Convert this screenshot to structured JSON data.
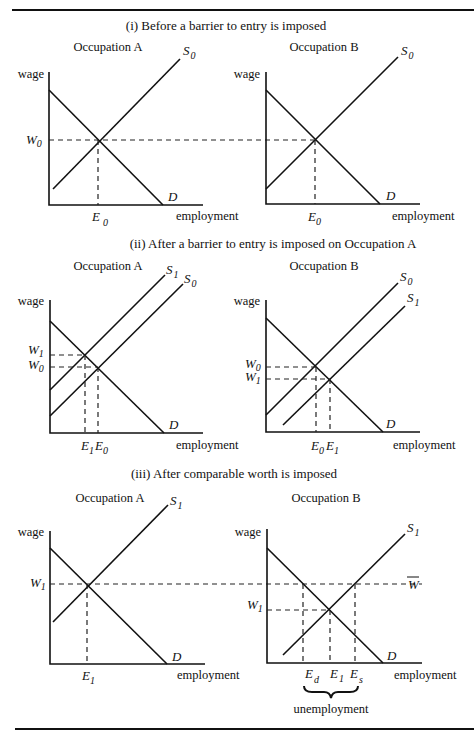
{
  "figure": {
    "panels": [
      {
        "title": "(i) Before a barrier to entry is imposed",
        "graphs": [
          {
            "occupation": "Occupation A",
            "y_axis_label": "wage",
            "x_axis_label": "employment",
            "supply_labels": [
              "S",
              "0"
            ],
            "demand_label": "D",
            "wage_labels": [
              [
                "W",
                "0"
              ]
            ],
            "employment_labels": [
              [
                "E",
                "0"
              ]
            ]
          },
          {
            "occupation": "Occupation B",
            "y_axis_label": "wage",
            "x_axis_label": "employment",
            "supply_labels": [
              "S",
              "0"
            ],
            "demand_label": "D",
            "employment_labels": [
              [
                "E",
                "0"
              ]
            ]
          }
        ]
      },
      {
        "title": "(ii) After a barrier to entry is imposed on Occupation A",
        "graphs": [
          {
            "occupation": "Occupation A",
            "y_axis_label": "wage",
            "x_axis_label": "employment",
            "supply_new": [
              "S",
              "1"
            ],
            "supply_old": [
              "S",
              "0"
            ],
            "demand_label": "D",
            "wage_labels": [
              [
                "W",
                "1"
              ],
              [
                "W",
                "0"
              ]
            ],
            "employment_labels": [
              [
                "E",
                "1"
              ],
              [
                "E",
                "0"
              ]
            ]
          },
          {
            "occupation": "Occupation B",
            "y_axis_label": "wage",
            "x_axis_label": "employment",
            "supply_old": [
              "S",
              "0"
            ],
            "supply_new": [
              "S",
              "1"
            ],
            "demand_label": "D",
            "wage_labels": [
              [
                "W",
                "0"
              ],
              [
                "W",
                "1"
              ]
            ],
            "employment_labels": [
              [
                "E",
                "0"
              ],
              [
                "E",
                "1"
              ]
            ]
          }
        ]
      },
      {
        "title": "(iii) After comparable worth is imposed",
        "graphs": [
          {
            "occupation": "Occupation A",
            "y_axis_label": "wage",
            "x_axis_label": "employment",
            "supply_labels": [
              "S",
              "1"
            ],
            "demand_label": "D",
            "wage_labels": [
              [
                "W",
                "1"
              ]
            ],
            "employment_labels": [
              [
                "E",
                "1"
              ]
            ]
          },
          {
            "occupation": "Occupation B",
            "y_axis_label": "wage",
            "x_axis_label": "employment",
            "supply_labels": [
              "S",
              "1"
            ],
            "demand_label": "D",
            "wage_bar": "W",
            "wage_labels": [
              [
                "W",
                "1"
              ]
            ],
            "employment_labels": [
              [
                "E",
                "d"
              ],
              [
                "E",
                "1"
              ],
              [
                "E",
                "s"
              ]
            ],
            "brace_label": "unemployment"
          }
        ]
      }
    ]
  }
}
